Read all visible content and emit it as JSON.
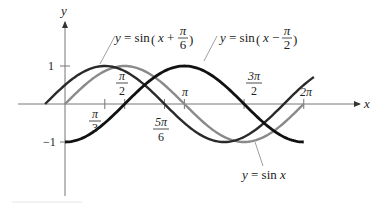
{
  "chart_data": {
    "type": "line",
    "title": "",
    "xlabel": "x",
    "ylabel": "y",
    "xlim": [
      -0.8,
      7.6
    ],
    "ylim": [
      -1.9,
      2.2
    ],
    "grid": false,
    "x_ticks": [
      {
        "value": 1.0472,
        "label_num": "π",
        "label_den": "3",
        "position": "below"
      },
      {
        "value": 1.5708,
        "label_num": "π",
        "label_den": "2",
        "position": "above"
      },
      {
        "value": 2.618,
        "label_num": "5π",
        "label_den": "6",
        "position": "below"
      },
      {
        "value": 3.1416,
        "label": "π",
        "position": "above"
      },
      {
        "value": 4.7124,
        "label_num": "3π",
        "label_den": "2",
        "position": "above"
      },
      {
        "value": 6.2832,
        "label": "2π",
        "position": "above"
      }
    ],
    "y_ticks": [
      {
        "value": 1,
        "label": "1"
      },
      {
        "value": -1,
        "label": "−1"
      }
    ],
    "series": [
      {
        "name": "y = sin(x + π/6)",
        "function": "sin(x + pi/6)",
        "x_range": [
          -0.5236,
          6.55
        ],
        "color": "#2a2a2a",
        "width": 2.4,
        "sample_points": [
          [
            -0.5236,
            0
          ],
          [
            1.0472,
            1
          ],
          [
            2.618,
            0
          ],
          [
            4.1888,
            -1
          ],
          [
            5.7596,
            0
          ],
          [
            6.55,
            0.68
          ]
        ]
      },
      {
        "name": "y = sin x",
        "function": "sin(x)",
        "x_range": [
          0,
          6.2832
        ],
        "color": "#8a8a8a",
        "width": 2.4,
        "sample_points": [
          [
            0,
            0
          ],
          [
            1.5708,
            1
          ],
          [
            3.1416,
            0
          ],
          [
            4.7124,
            -1
          ],
          [
            6.2832,
            0
          ]
        ]
      },
      {
        "name": "y = sin(x − π/2)",
        "function": "sin(x - pi/2)",
        "x_range": [
          0,
          6.2832
        ],
        "color": "#111111",
        "width": 2.8,
        "sample_points": [
          [
            0,
            -1
          ],
          [
            1.5708,
            0
          ],
          [
            3.1416,
            1
          ],
          [
            4.7124,
            0
          ],
          [
            6.2832,
            -1
          ]
        ]
      }
    ],
    "annotations": [
      {
        "text_prefix": "y = sin",
        "arg": "x +",
        "frac_num": "π",
        "frac_den": "6",
        "target_series": 0
      },
      {
        "text_prefix": "y = sin",
        "arg": "x −",
        "frac_num": "π",
        "frac_den": "2",
        "target_series": 2
      },
      {
        "text": "y = sin x",
        "target_series": 1
      }
    ]
  },
  "layout": {
    "origin_px": [
      65,
      104
    ],
    "x_scale": 38.0,
    "y_scale": 38.0
  },
  "labels": {
    "x_axis": "x",
    "y_axis": "y",
    "y1": "1",
    "ym1": "−1",
    "pi3_num": "π",
    "pi3_den": "3",
    "pi2_num": "π",
    "pi2_den": "2",
    "fivepi6_num": "5π",
    "fivepi6_den": "6",
    "pi": "π",
    "threepi2_num": "3π",
    "threepi2_den": "2",
    "twopi": "2π",
    "eq1_y": "y",
    "eq1_eq": " = sin",
    "eq1_x": "x",
    "eq1_op": " +",
    "eq1_num": "π",
    "eq1_den": "6",
    "eq2_y": "y",
    "eq2_eq": " = sin",
    "eq2_x": "x",
    "eq2_op": " −",
    "eq2_num": "π",
    "eq2_den": "2",
    "eq3_y": "y",
    "eq3_eq": " = sin ",
    "eq3_x": "x"
  }
}
